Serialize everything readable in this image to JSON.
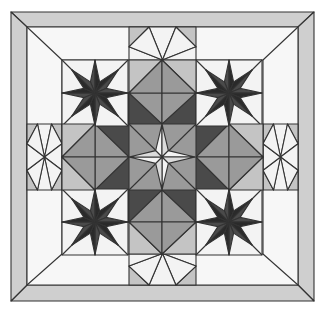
{
  "image": {
    "description": "Quilt block: four dark eight-pointed stars around a central gray square with a white four-pointed star, framed by light gray mitered border",
    "colors": {
      "background": "#ffffff",
      "border": "#cfcfcf",
      "field": "#f7f7f7",
      "white": "#f3f3f3",
      "light": "#c4c4c4",
      "medium": "#9a9a9a",
      "dark": "#4a4a4a",
      "darkest": "#2a2a2a",
      "line": "#333333"
    }
  }
}
